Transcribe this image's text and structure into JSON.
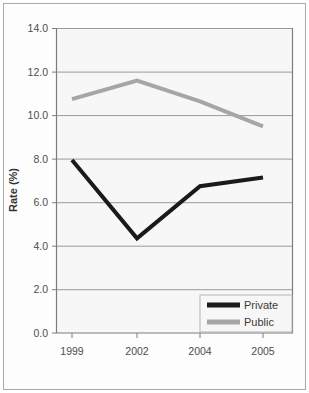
{
  "chart_data": {
    "type": "line",
    "title": "",
    "xlabel": "",
    "ylabel": "Rate (%)",
    "categories": [
      "1999",
      "2002",
      "2004",
      "2005"
    ],
    "series": [
      {
        "name": "Private",
        "values": [
          7.95,
          4.35,
          6.75,
          7.15
        ],
        "color": "#1a1a1a"
      },
      {
        "name": "Public",
        "values": [
          10.75,
          11.6,
          10.65,
          9.5
        ],
        "color": "#a6a6a6"
      }
    ],
    "ylim": [
      0.0,
      14.0
    ],
    "ytick_labels": [
      "14.0",
      "12.0",
      "10.0",
      "8.0",
      "6.0",
      "4.0",
      "2.0",
      "0.0"
    ],
    "ytick_values": [
      14.0,
      12.0,
      10.0,
      8.0,
      6.0,
      4.0,
      2.0,
      0.0
    ],
    "grid": true,
    "legend_position": "bottom-right",
    "legend_entries": [
      "Private",
      "Public"
    ],
    "plot_background": "#f7f7f7",
    "grid_color": "#999999",
    "axis_color": "#808080"
  },
  "axis": {
    "ylabel": "Rate (%)"
  },
  "yticks": {
    "t0": "14.0",
    "t1": "12.0",
    "t2": "10.0",
    "t3": "8.0",
    "t4": "6.0",
    "t5": "4.0",
    "t6": "2.0",
    "t7": "0.0"
  },
  "xticks": {
    "t0": "1999",
    "t1": "2002",
    "t2": "2004",
    "t3": "2005"
  },
  "legend": {
    "private_label": "Private",
    "public_label": "Public"
  }
}
